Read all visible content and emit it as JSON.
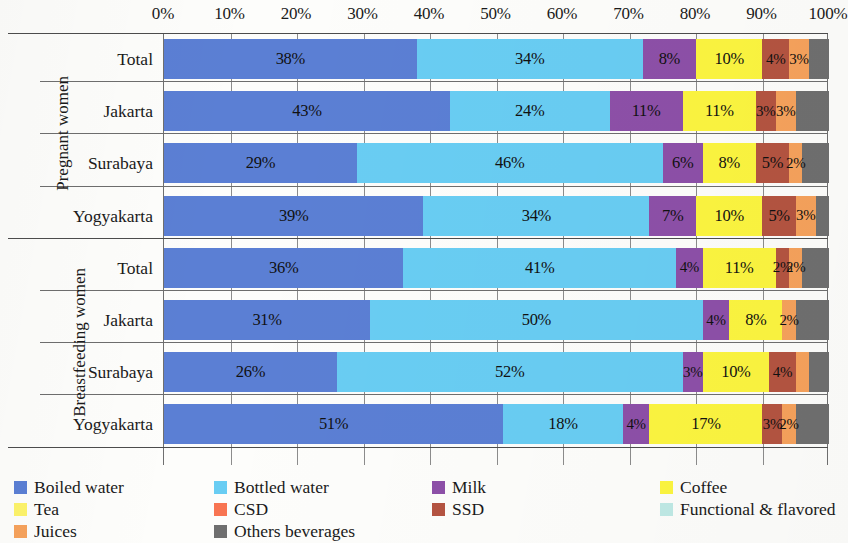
{
  "chart_data": {
    "type": "bar",
    "orientation": "horizontal",
    "stacked": true,
    "normalized": "100%",
    "title": "",
    "xlabel": "",
    "ylabel": "",
    "xlim": [
      0,
      100
    ],
    "grid": true,
    "legend_position": "bottom",
    "x_ticks": [
      "0%",
      "10%",
      "20%",
      "30%",
      "40%",
      "50%",
      "60%",
      "70%",
      "80%",
      "90%",
      "100%"
    ],
    "x_tick_values": [
      0,
      10,
      20,
      30,
      40,
      50,
      60,
      70,
      80,
      90,
      100
    ],
    "groups": [
      {
        "name": "Pregnant women",
        "categories": [
          "Total",
          "Jakarta",
          "Surabaya",
          "Yogyakarta"
        ]
      },
      {
        "name": "Breastfeeding women",
        "categories": [
          "Total",
          "Jakarta",
          "Surabaya",
          "Yogyakarta"
        ]
      }
    ],
    "categories": [
      "Pregnant women - Total",
      "Pregnant women - Jakarta",
      "Pregnant women - Surabaya",
      "Pregnant women - Yogyakarta",
      "Breastfeeding women - Total",
      "Breastfeeding women - Jakarta",
      "Breastfeeding women - Surabaya",
      "Breastfeeding women - Yogyakarta"
    ],
    "series": [
      {
        "name": "Boiled water",
        "color": "#5b7fd4",
        "values": [
          38,
          43,
          29,
          39,
          36,
          31,
          26,
          51
        ]
      },
      {
        "name": "Bottled water",
        "color": "#69cdf3",
        "values": [
          34,
          24,
          46,
          34,
          41,
          50,
          52,
          18
        ]
      },
      {
        "name": "Milk",
        "color": "#8d50a8",
        "values": [
          8,
          11,
          6,
          7,
          4,
          4,
          3,
          4
        ]
      },
      {
        "name": "Coffee",
        "color": "#fcf540",
        "values": [
          10,
          11,
          8,
          10,
          11,
          8,
          10,
          17
        ]
      },
      {
        "name": "Tea",
        "color": "#fdf36a",
        "values": [
          0,
          0,
          0,
          0,
          0,
          0,
          0,
          0
        ]
      },
      {
        "name": "CSD",
        "color": "#f87552",
        "values": [
          0,
          0,
          0,
          0,
          0,
          0,
          0,
          0
        ]
      },
      {
        "name": "SSD",
        "color": "#b45441",
        "values": [
          4,
          3,
          5,
          5,
          2,
          0,
          4,
          3
        ]
      },
      {
        "name": "Functional & flavored",
        "color": "#bfe9e5",
        "values": [
          0,
          0,
          0,
          0,
          0,
          0,
          0,
          0
        ]
      },
      {
        "name": "Juices",
        "color": "#f6a25c",
        "values": [
          3,
          3,
          2,
          3,
          2,
          2,
          2,
          2
        ]
      },
      {
        "name": "Others beverages",
        "color": "#6f6f6f",
        "values": [
          3,
          5,
          4,
          2,
          4,
          5,
          3,
          5
        ]
      }
    ],
    "rows": [
      {
        "group": "Pregnant women",
        "label": "Total",
        "segments": [
          {
            "series": "Boiled water",
            "value": 38,
            "label": "38%"
          },
          {
            "series": "Bottled water",
            "value": 34,
            "label": "34%"
          },
          {
            "series": "Milk",
            "value": 8,
            "label": "8%"
          },
          {
            "series": "Coffee",
            "value": 10,
            "label": "10%"
          },
          {
            "series": "SSD",
            "value": 4,
            "label": "4%"
          },
          {
            "series": "Juices",
            "value": 3,
            "label": "3%"
          },
          {
            "series": "Others beverages",
            "value": 3,
            "label": ""
          }
        ]
      },
      {
        "group": "Pregnant women",
        "label": "Jakarta",
        "segments": [
          {
            "series": "Boiled water",
            "value": 43,
            "label": "43%"
          },
          {
            "series": "Bottled water",
            "value": 24,
            "label": "24%"
          },
          {
            "series": "Milk",
            "value": 11,
            "label": "11%"
          },
          {
            "series": "Coffee",
            "value": 11,
            "label": "11%"
          },
          {
            "series": "SSD",
            "value": 3,
            "label": "3%"
          },
          {
            "series": "Juices",
            "value": 3,
            "label": "3%"
          },
          {
            "series": "Others beverages",
            "value": 5,
            "label": ""
          }
        ]
      },
      {
        "group": "Pregnant women",
        "label": "Surabaya",
        "segments": [
          {
            "series": "Boiled water",
            "value": 29,
            "label": "29%"
          },
          {
            "series": "Bottled water",
            "value": 46,
            "label": "46%"
          },
          {
            "series": "Milk",
            "value": 6,
            "label": "6%"
          },
          {
            "series": "Coffee",
            "value": 8,
            "label": "8%"
          },
          {
            "series": "SSD",
            "value": 5,
            "label": "5%"
          },
          {
            "series": "Juices",
            "value": 2,
            "label": "2%"
          },
          {
            "series": "Others beverages",
            "value": 4,
            "label": ""
          }
        ]
      },
      {
        "group": "Pregnant women",
        "label": "Yogyakarta",
        "segments": [
          {
            "series": "Boiled water",
            "value": 39,
            "label": "39%"
          },
          {
            "series": "Bottled water",
            "value": 34,
            "label": "34%"
          },
          {
            "series": "Milk",
            "value": 7,
            "label": "7%"
          },
          {
            "series": "Coffee",
            "value": 10,
            "label": "10%"
          },
          {
            "series": "SSD",
            "value": 5,
            "label": "5%"
          },
          {
            "series": "Juices",
            "value": 3,
            "label": "3%"
          },
          {
            "series": "Others beverages",
            "value": 2,
            "label": ""
          }
        ]
      },
      {
        "group": "Breastfeeding women",
        "label": "Total",
        "segments": [
          {
            "series": "Boiled water",
            "value": 36,
            "label": "36%"
          },
          {
            "series": "Bottled water",
            "value": 41,
            "label": "41%"
          },
          {
            "series": "Milk",
            "value": 4,
            "label": "4%"
          },
          {
            "series": "Coffee",
            "value": 11,
            "label": "11%"
          },
          {
            "series": "SSD",
            "value": 2,
            "label": "2%"
          },
          {
            "series": "Juices",
            "value": 2,
            "label": "2%"
          },
          {
            "series": "Others beverages",
            "value": 4,
            "label": ""
          }
        ]
      },
      {
        "group": "Breastfeeding women",
        "label": "Jakarta",
        "segments": [
          {
            "series": "Boiled water",
            "value": 31,
            "label": "31%"
          },
          {
            "series": "Bottled water",
            "value": 50,
            "label": "50%"
          },
          {
            "series": "Milk",
            "value": 4,
            "label": "4%"
          },
          {
            "series": "Coffee",
            "value": 8,
            "label": "8%"
          },
          {
            "series": "Juices",
            "value": 2,
            "label": "2%"
          },
          {
            "series": "Others beverages",
            "value": 5,
            "label": ""
          }
        ]
      },
      {
        "group": "Breastfeeding women",
        "label": "Surabaya",
        "segments": [
          {
            "series": "Boiled water",
            "value": 26,
            "label": "26%"
          },
          {
            "series": "Bottled water",
            "value": 52,
            "label": "52%"
          },
          {
            "series": "Milk",
            "value": 3,
            "label": "3%"
          },
          {
            "series": "Coffee",
            "value": 10,
            "label": "10%"
          },
          {
            "series": "SSD",
            "value": 4,
            "label": "4%"
          },
          {
            "series": "Juices",
            "value": 2,
            "label": ""
          },
          {
            "series": "Others beverages",
            "value": 3,
            "label": ""
          }
        ]
      },
      {
        "group": "Breastfeeding women",
        "label": "Yogyakarta",
        "segments": [
          {
            "series": "Boiled water",
            "value": 51,
            "label": "51%"
          },
          {
            "series": "Bottled water",
            "value": 18,
            "label": "18%"
          },
          {
            "series": "Milk",
            "value": 4,
            "label": "4%"
          },
          {
            "series": "Coffee",
            "value": 17,
            "label": "17%"
          },
          {
            "series": "SSD",
            "value": 3,
            "label": "3%"
          },
          {
            "series": "Juices",
            "value": 2,
            "label": "2%"
          },
          {
            "series": "Others beverages",
            "value": 5,
            "label": ""
          }
        ]
      }
    ],
    "legend": [
      {
        "label": "Boiled water",
        "color": "#5b7fd4",
        "col": 0,
        "row": 0
      },
      {
        "label": "Bottled water",
        "color": "#69cdf3",
        "col": 1,
        "row": 0
      },
      {
        "label": "Milk",
        "color": "#8d50a8",
        "col": 2,
        "row": 0
      },
      {
        "label": "Coffee",
        "color": "#fcf540",
        "col": 3,
        "row": 0
      },
      {
        "label": "Tea",
        "color": "#fdf36a",
        "col": 0,
        "row": 1
      },
      {
        "label": "CSD",
        "color": "#f87552",
        "col": 1,
        "row": 1
      },
      {
        "label": "SSD",
        "color": "#b45441",
        "col": 2,
        "row": 1
      },
      {
        "label": "Functional & flavored",
        "color": "#bfe9e5",
        "col": 3,
        "row": 1
      },
      {
        "label": "Juices",
        "color": "#f6a25c",
        "col": 0,
        "row": 2
      },
      {
        "label": "Others beverages",
        "color": "#6f6f6f",
        "col": 1,
        "row": 2
      }
    ]
  }
}
